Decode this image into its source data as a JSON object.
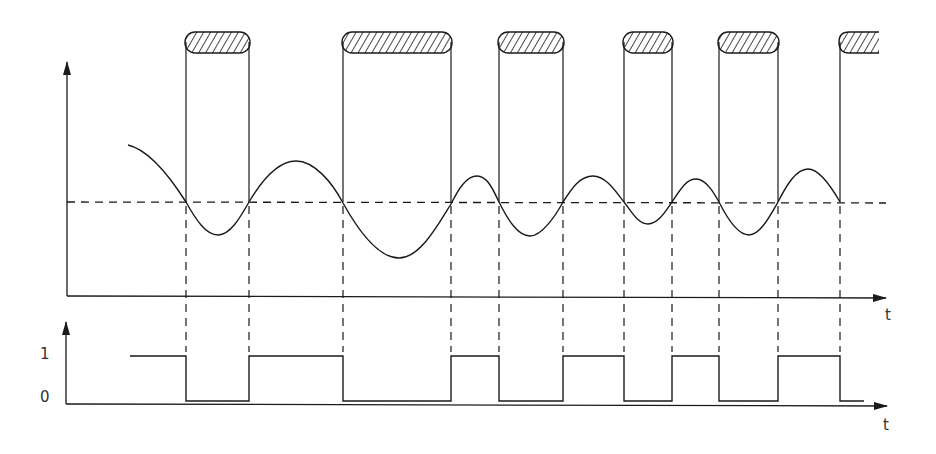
{
  "diagram": {
    "type": "timing-diagram",
    "colors": {
      "stroke": "#1a1a1a",
      "background": "#ffffff",
      "hatch": "#1a1a1a"
    },
    "upper_plot": {
      "x_axis_label": "t",
      "threshold_level_y": 202,
      "pulses": [
        {
          "index": 1,
          "start_x": 186,
          "end_x": 249,
          "cut_off": false
        },
        {
          "index": 2,
          "start_x": 343,
          "end_x": 451,
          "cut_off": false
        },
        {
          "index": 3,
          "start_x": 499,
          "end_x": 563,
          "cut_off": false
        },
        {
          "index": 4,
          "start_x": 624,
          "end_x": 672,
          "cut_off": false
        },
        {
          "index": 5,
          "start_x": 719,
          "end_x": 778,
          "cut_off": false
        },
        {
          "index": 6,
          "start_x": 840,
          "end_x": 879,
          "cut_off": true
        }
      ],
      "crossings_x": [
        186,
        249,
        343,
        451,
        499,
        563,
        624,
        672,
        719,
        778,
        840
      ],
      "curve_extrema": [
        {
          "x": 128,
          "y": 145,
          "kind": "start"
        },
        {
          "x": 218,
          "y": 235,
          "kind": "min"
        },
        {
          "x": 296,
          "y": 161,
          "kind": "max"
        },
        {
          "x": 399,
          "y": 258,
          "kind": "min"
        },
        {
          "x": 477,
          "y": 176,
          "kind": "max"
        },
        {
          "x": 530,
          "y": 236,
          "kind": "min"
        },
        {
          "x": 593,
          "y": 176,
          "kind": "max"
        },
        {
          "x": 648,
          "y": 224,
          "kind": "min"
        },
        {
          "x": 696,
          "y": 179,
          "kind": "max"
        },
        {
          "x": 749,
          "y": 235,
          "kind": "min"
        },
        {
          "x": 808,
          "y": 169,
          "kind": "max"
        }
      ]
    },
    "lower_plot": {
      "x_axis_label": "t",
      "y_labels": {
        "high": "1",
        "low": "0"
      },
      "digital_sequence": [
        {
          "from_x": 130,
          "to_x": 186,
          "level": 1
        },
        {
          "from_x": 186,
          "to_x": 249,
          "level": 0
        },
        {
          "from_x": 249,
          "to_x": 343,
          "level": 1
        },
        {
          "from_x": 343,
          "to_x": 451,
          "level": 0
        },
        {
          "from_x": 451,
          "to_x": 499,
          "level": 1
        },
        {
          "from_x": 499,
          "to_x": 563,
          "level": 0
        },
        {
          "from_x": 563,
          "to_x": 624,
          "level": 1
        },
        {
          "from_x": 624,
          "to_x": 672,
          "level": 0
        },
        {
          "from_x": 672,
          "to_x": 719,
          "level": 1
        },
        {
          "from_x": 719,
          "to_x": 778,
          "level": 0
        },
        {
          "from_x": 778,
          "to_x": 840,
          "level": 1
        },
        {
          "from_x": 840,
          "to_x": 864,
          "level": 0
        }
      ]
    }
  }
}
